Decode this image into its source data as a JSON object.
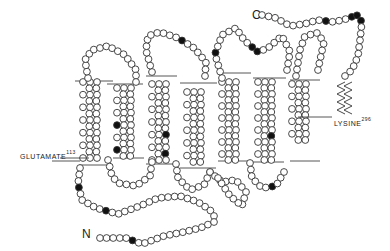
{
  "diagram": {
    "terminals": {
      "c": "C",
      "n": "N"
    },
    "labels": {
      "glutamate": {
        "name": "GLUTAMATE",
        "number": "113"
      },
      "lysine": {
        "name": "LYSINE",
        "number": "296"
      }
    },
    "colors": {
      "line": "#333333",
      "filled": "#111111",
      "open": "#ffffff"
    },
    "membrane_lines": {
      "top": [
        [
          75,
          242,
          113,
          104
        ],
        [
          108,
          131,
          144,
          155
        ],
        [
          177,
          247,
          227,
          254
        ]
      ],
      "top_y": [
        81,
        84,
        77,
        78
      ],
      "bottom": []
    },
    "helices": [
      {
        "id": "H1",
        "x": 93,
        "top": 78,
        "bottom": 160
      },
      {
        "id": "H2",
        "x": 127,
        "top": 82,
        "bottom": 157
      },
      {
        "id": "H3",
        "x": 162,
        "top": 76,
        "bottom": 160
      },
      {
        "id": "H4",
        "x": 196,
        "top": 85,
        "bottom": 163
      },
      {
        "id": "H5",
        "x": 232,
        "top": 75,
        "bottom": 163
      },
      {
        "id": "H6",
        "x": 268,
        "top": 76,
        "bottom": 163
      },
      {
        "id": "H7",
        "x": 303,
        "top": 80,
        "bottom": 163
      }
    ]
  }
}
